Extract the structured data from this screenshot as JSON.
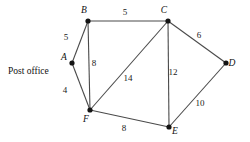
{
  "figure": {
    "type": "weighted-undirected-graph",
    "background_color": "#ffffff",
    "node_color": "#141414",
    "edge_color": "#4a4a4a",
    "text_color": "#111111"
  },
  "nodes": [
    {
      "id": "A",
      "label": "A",
      "x": 72,
      "y": 63,
      "label_x": 64,
      "label_y": 60
    },
    {
      "id": "B",
      "label": "B",
      "x": 88,
      "y": 21,
      "label_x": 84,
      "label_y": 13
    },
    {
      "id": "C",
      "label": "C",
      "x": 168,
      "y": 21,
      "label_x": 164,
      "label_y": 13
    },
    {
      "id": "D",
      "label": "D",
      "x": 226,
      "y": 63,
      "label_x": 232,
      "label_y": 66
    },
    {
      "id": "E",
      "label": "E",
      "x": 169,
      "y": 127,
      "label_x": 175,
      "label_y": 134
    },
    {
      "id": "F",
      "label": "F",
      "x": 90,
      "y": 110,
      "label_x": 86,
      "label_y": 122
    }
  ],
  "edges": [
    {
      "from": "A",
      "to": "B",
      "weight": "5",
      "label_x": 66,
      "label_y": 40
    },
    {
      "from": "A",
      "to": "F",
      "weight": "4",
      "label_x": 65,
      "label_y": 93
    },
    {
      "from": "B",
      "to": "C",
      "weight": "5",
      "label_x": 125,
      "label_y": 15
    },
    {
      "from": "B",
      "to": "F",
      "weight": "8",
      "label_x": 94,
      "label_y": 66
    },
    {
      "from": "B",
      "to": "A",
      "weight": "",
      "label_x": 0,
      "label_y": 0
    },
    {
      "from": "C",
      "to": "D",
      "weight": "6",
      "label_x": 199,
      "label_y": 38
    },
    {
      "from": "C",
      "to": "E",
      "weight": "12",
      "label_x": 173,
      "label_y": 75
    },
    {
      "from": "C",
      "to": "F",
      "weight": "14",
      "label_x": 128,
      "label_y": 81
    },
    {
      "from": "D",
      "to": "E",
      "weight": "10",
      "label_x": 200,
      "label_y": 106
    },
    {
      "from": "F",
      "to": "E",
      "weight": "8",
      "label_x": 124,
      "label_y": 131
    }
  ],
  "annotations": [
    {
      "name": "post-office-label",
      "text": "Post office",
      "x": 8,
      "y": 74
    }
  ],
  "chart_data": {
    "type": "diagram",
    "title": "",
    "vertices": [
      "A",
      "B",
      "C",
      "D",
      "E",
      "F"
    ],
    "weighted_edges": [
      [
        "A",
        "B",
        5
      ],
      [
        "A",
        "F",
        4
      ],
      [
        "B",
        "C",
        5
      ],
      [
        "B",
        "F",
        8
      ],
      [
        "C",
        "D",
        6
      ],
      [
        "C",
        "E",
        12
      ],
      [
        "C",
        "F",
        14
      ],
      [
        "D",
        "E",
        10
      ],
      [
        "F",
        "E",
        8
      ]
    ],
    "notes": [
      "A is labelled Post office"
    ]
  }
}
